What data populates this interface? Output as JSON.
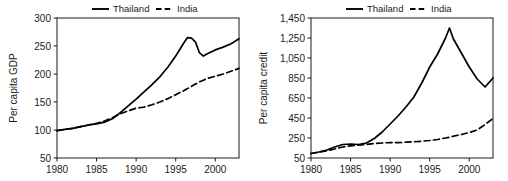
{
  "figure": {
    "background": "#ffffff",
    "line_color": "#000000",
    "text_color": "#1a1a1a"
  },
  "chart_data": [
    {
      "id": "gdp",
      "type": "line",
      "title": "",
      "xlabel": "",
      "ylabel": "Per capita GDP",
      "xlim": [
        1980,
        2003
      ],
      "ylim": [
        50,
        300
      ],
      "xticks": [
        1980,
        1985,
        1990,
        1995,
        2000
      ],
      "xtick_labels": [
        "1980",
        "1985",
        "1990",
        "1995",
        "2000"
      ],
      "yticks": [
        50,
        100,
        150,
        200,
        250,
        300
      ],
      "ytick_labels": [
        "50",
        "100",
        "150",
        "200",
        "250",
        "300"
      ],
      "grid": false,
      "legend_position": "top-center",
      "legend": [
        "Thailand",
        "India"
      ],
      "x": [
        1980,
        1981,
        1982,
        1983,
        1984,
        1985,
        1986,
        1987,
        1988,
        1989,
        1990,
        1991,
        1992,
        1993,
        1994,
        1995,
        1996,
        1996.5,
        1997,
        1997.5,
        1998,
        1998.5,
        1999,
        2000,
        2001,
        2002,
        2003
      ],
      "series": [
        {
          "name": "Thailand",
          "style": "solid",
          "values": [
            99,
            101,
            103,
            106,
            109,
            111,
            114,
            120,
            131,
            143,
            155,
            168,
            181,
            195,
            212,
            232,
            255,
            265,
            264,
            257,
            238,
            232,
            236,
            243,
            248,
            254,
            263
          ]
        },
        {
          "name": "India",
          "style": "dashed",
          "values": [
            99,
            101,
            103,
            106,
            109,
            112,
            116,
            122,
            129,
            134,
            139,
            141,
            145,
            150,
            156,
            163,
            170,
            174,
            178,
            182,
            186,
            189,
            192,
            196,
            200,
            205,
            210
          ]
        }
      ]
    },
    {
      "id": "credit",
      "type": "line",
      "title": "",
      "xlabel": "",
      "ylabel": "Per capita credit",
      "xlim": [
        1980,
        2003
      ],
      "ylim": [
        50,
        1450
      ],
      "xticks": [
        1980,
        1985,
        1990,
        1995,
        2000
      ],
      "xtick_labels": [
        "1980",
        "1985",
        "1990",
        "1995",
        "2000"
      ],
      "yticks": [
        50,
        250,
        450,
        650,
        850,
        1050,
        1250,
        1450
      ],
      "ytick_labels": [
        "50",
        "250",
        "450",
        "650",
        "850",
        "1,050",
        "1,250",
        "1,450"
      ],
      "grid": false,
      "legend_position": "top-center",
      "legend": [
        "Thailand",
        "India"
      ],
      "x": [
        1980,
        1981,
        1982,
        1983,
        1984,
        1985,
        1986,
        1987,
        1988,
        1989,
        1990,
        1991,
        1992,
        1993,
        1994,
        1995,
        1996,
        1997,
        1997.5,
        1998,
        1999,
        2000,
        2001,
        2002,
        2003
      ],
      "series": [
        {
          "name": "Thailand",
          "style": "solid",
          "values": [
            95,
            110,
            130,
            160,
            185,
            190,
            185,
            200,
            245,
            310,
            390,
            470,
            560,
            660,
            800,
            960,
            1090,
            1250,
            1350,
            1240,
            1100,
            960,
            840,
            760,
            850
          ]
        },
        {
          "name": "India",
          "style": "dashed",
          "values": [
            95,
            108,
            122,
            140,
            160,
            172,
            178,
            185,
            195,
            200,
            205,
            203,
            208,
            212,
            218,
            225,
            235,
            250,
            258,
            268,
            285,
            305,
            330,
            385,
            445
          ]
        }
      ]
    }
  ]
}
